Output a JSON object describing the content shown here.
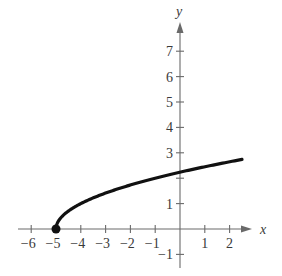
{
  "chart_data": {
    "type": "line",
    "title": "",
    "function": "y = sqrt(x + 5)",
    "xlabel": "x",
    "ylabel": "y",
    "xlim": [
      -6.5,
      2.9
    ],
    "ylim": [
      -1.3,
      8.3
    ],
    "x_ticks": [
      -6,
      -5,
      -4,
      -3,
      -2,
      -1,
      1,
      2
    ],
    "x_tick_labels": [
      "−6",
      "−5",
      "−4",
      "−3",
      "−2",
      "−1",
      "1",
      "2"
    ],
    "y_ticks": [
      -1,
      1,
      2,
      3,
      4,
      5,
      6,
      7
    ],
    "y_tick_labels": [
      "−1",
      "1",
      "",
      "3",
      "4",
      "5",
      "6",
      "7"
    ],
    "grid": false,
    "legend": null,
    "series": [
      {
        "name": "sqrt(x+5)",
        "x": [
          -5,
          -4.75,
          -4.5,
          -4,
          -3,
          -2,
          -1,
          0,
          1,
          2,
          2.5
        ],
        "values": [
          0,
          0.5,
          0.707,
          1,
          1.414,
          1.732,
          2,
          2.236,
          2.449,
          2.646,
          2.739
        ]
      }
    ],
    "annotations": [
      {
        "type": "closed-point",
        "x": -5,
        "y": 0
      }
    ]
  },
  "layout": {
    "origin_px": [
      180,
      229
    ],
    "unit_x_px": 24.8,
    "unit_y_px": 25.4,
    "x_axis_px": [
      18,
      252
    ],
    "y_axis_px": [
      268,
      22
    ]
  }
}
